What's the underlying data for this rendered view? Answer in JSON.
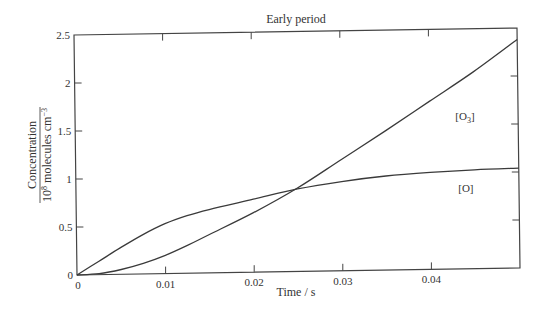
{
  "chart_data": {
    "type": "line",
    "title": "Early period",
    "xlabel": "Time / s",
    "ylabel_numerator": "Concentration",
    "ylabel_denominator": "10^8 molecules cm^-3",
    "xlim": [
      0,
      0.05
    ],
    "ylim": [
      0,
      2.5
    ],
    "xticks": [
      0,
      0.01,
      0.02,
      0.03,
      0.04
    ],
    "xtick_labels": [
      "0",
      "0.01",
      "0.02",
      "0.03",
      "0.04"
    ],
    "yticks": [
      0,
      0.5,
      1,
      1.5,
      2,
      2.5
    ],
    "ytick_labels": [
      "0",
      "0.5",
      "1",
      "1.5",
      "2",
      "2.5"
    ],
    "grid": false,
    "legend": "inline labels",
    "series": [
      {
        "name": "[O]",
        "label": "[O]",
        "x": [
          0,
          0.0025,
          0.005,
          0.0075,
          0.01,
          0.0125,
          0.015,
          0.02,
          0.025,
          0.03,
          0.035,
          0.04,
          0.045,
          0.05
        ],
        "values": [
          0,
          0.14,
          0.28,
          0.41,
          0.52,
          0.6,
          0.66,
          0.76,
          0.86,
          0.93,
          0.98,
          1.01,
          1.03,
          1.04
        ]
      },
      {
        "name": "[O3]",
        "label": "[O3]",
        "x": [
          0,
          0.0025,
          0.005,
          0.0075,
          0.01,
          0.0125,
          0.015,
          0.02,
          0.025,
          0.03,
          0.035,
          0.04,
          0.045,
          0.05
        ],
        "values": [
          0,
          0.01,
          0.05,
          0.11,
          0.19,
          0.29,
          0.4,
          0.62,
          0.87,
          1.16,
          1.45,
          1.75,
          2.05,
          2.38
        ]
      }
    ],
    "annotations": [
      {
        "text": "[O3]",
        "x": 0.044,
        "y": 1.55
      },
      {
        "text": "[O]",
        "x": 0.044,
        "y": 0.8
      }
    ]
  }
}
